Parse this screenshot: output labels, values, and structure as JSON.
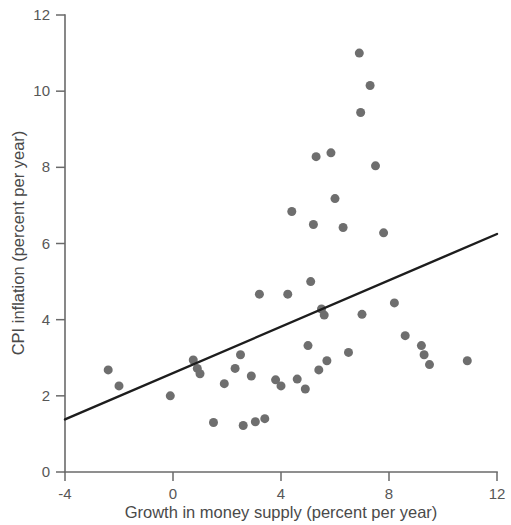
{
  "chart_data": {
    "type": "scatter",
    "title": "",
    "xlabel": "Growth in money supply (percent per year)",
    "ylabel": "CPI inflation (percent per year)",
    "xlim": [
      -4,
      12
    ],
    "ylim": [
      0,
      12
    ],
    "xticks": [
      -4,
      0,
      4,
      8,
      12
    ],
    "yticks": [
      0,
      2,
      4,
      6,
      8,
      10,
      12
    ],
    "xtick_labels": [
      "-4",
      "0",
      "4",
      "8",
      "12"
    ],
    "ytick_labels": [
      "0",
      "2",
      "4",
      "6",
      "8",
      "10",
      "12"
    ],
    "grid": false,
    "legend": false,
    "marker_color": "#6e6e6e",
    "marker_size": 9,
    "series": [
      {
        "name": "Countries",
        "type": "scatter",
        "points": [
          [
            -2.4,
            2.68
          ],
          [
            -2.0,
            2.26
          ],
          [
            -0.1,
            2.0
          ],
          [
            0.75,
            2.94
          ],
          [
            0.9,
            2.72
          ],
          [
            1.0,
            2.58
          ],
          [
            1.5,
            1.3
          ],
          [
            1.9,
            2.32
          ],
          [
            2.3,
            2.72
          ],
          [
            2.5,
            3.08
          ],
          [
            2.6,
            1.22
          ],
          [
            2.9,
            2.52
          ],
          [
            3.05,
            1.32
          ],
          [
            3.2,
            4.67
          ],
          [
            3.4,
            1.4
          ],
          [
            3.8,
            2.42
          ],
          [
            4.0,
            2.26
          ],
          [
            4.25,
            4.67
          ],
          [
            4.4,
            6.84
          ],
          [
            4.6,
            2.44
          ],
          [
            4.9,
            2.18
          ],
          [
            5.0,
            3.32
          ],
          [
            5.1,
            5.0
          ],
          [
            5.2,
            6.5
          ],
          [
            5.3,
            8.28
          ],
          [
            5.4,
            2.68
          ],
          [
            5.5,
            4.28
          ],
          [
            5.6,
            4.12
          ],
          [
            5.7,
            2.92
          ],
          [
            5.85,
            8.38
          ],
          [
            6.0,
            7.18
          ],
          [
            6.3,
            6.42
          ],
          [
            6.5,
            3.14
          ],
          [
            6.9,
            11.0
          ],
          [
            6.95,
            9.44
          ],
          [
            7.0,
            4.14
          ],
          [
            7.3,
            10.15
          ],
          [
            7.5,
            8.04
          ],
          [
            7.8,
            6.28
          ],
          [
            8.2,
            4.44
          ],
          [
            8.6,
            3.58
          ],
          [
            9.2,
            3.32
          ],
          [
            9.3,
            3.08
          ],
          [
            9.5,
            2.82
          ],
          [
            10.9,
            2.92
          ]
        ]
      },
      {
        "name": "Fitted regression line",
        "type": "line",
        "points": [
          [
            -4,
            1.38
          ],
          [
            12,
            6.25
          ]
        ],
        "color": "#1d1d1d"
      }
    ]
  }
}
